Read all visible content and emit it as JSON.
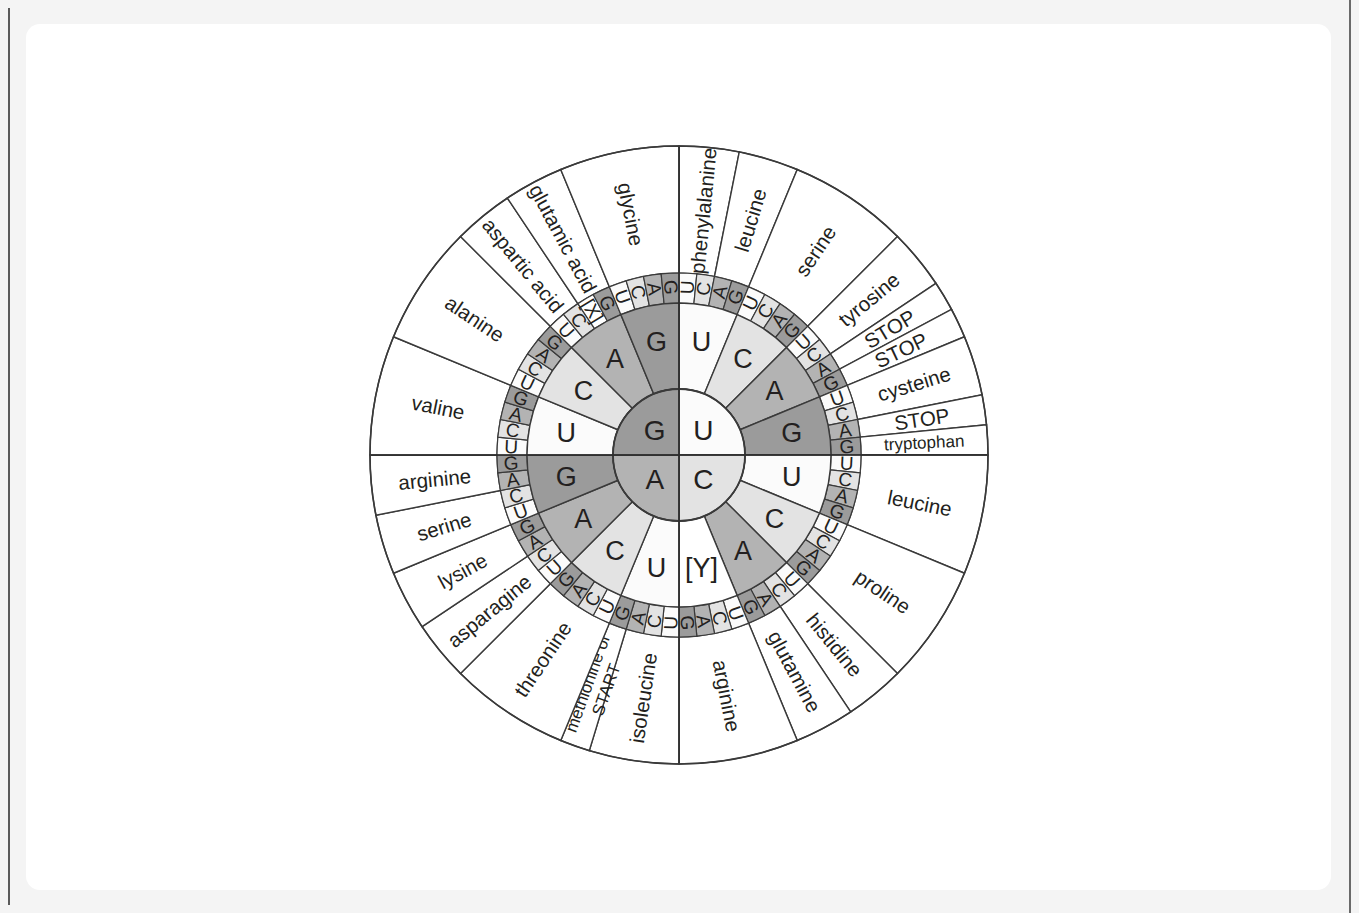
{
  "diagram": {
    "center_bases": [
      {
        "label": "U",
        "quadrant": "top-right",
        "shade": "lightest"
      },
      {
        "label": "C",
        "quadrant": "bottom-right",
        "shade": "light"
      },
      {
        "label": "A",
        "quadrant": "bottom-left",
        "shade": "medium"
      },
      {
        "label": "G",
        "quadrant": "top-left",
        "shade": "dark"
      }
    ],
    "ring2_bases": [
      "U",
      "C",
      "A",
      "G",
      "U",
      "C",
      "A",
      "[Y]",
      "U",
      "C",
      "A",
      "G",
      "U",
      "C",
      "A",
      "G"
    ],
    "ring3_bases": [
      "U",
      "C",
      "A",
      "G",
      "U",
      "C",
      "A",
      "G",
      "U",
      "C",
      "A",
      "G",
      "U",
      "C",
      "A",
      "G",
      "U",
      "C",
      "A",
      "G",
      "U",
      "C",
      "A",
      "G",
      "U",
      "C",
      "A",
      "G",
      "U",
      "C",
      "A",
      "G",
      "U",
      "C",
      "A",
      "G",
      "U",
      "C",
      "A",
      "G",
      "U",
      "C",
      "A",
      "G",
      "U",
      "C",
      "A",
      "G",
      "U",
      "C",
      "A",
      "G",
      "U",
      "C",
      "A",
      "G",
      "U",
      "C",
      "[X]",
      "G",
      "U",
      "C",
      "A",
      "G"
    ],
    "amino_acids": [
      {
        "name": "phenylalanine",
        "span": 2,
        "codons": [
          "UUU",
          "UUC"
        ]
      },
      {
        "name": "leucine",
        "span": 2,
        "codons": [
          "UUA",
          "UUG"
        ]
      },
      {
        "name": "serine",
        "span": 4,
        "codons": [
          "UCU",
          "UCC",
          "UCA",
          "UCG"
        ]
      },
      {
        "name": "tyrosine",
        "span": 2,
        "codons": [
          "UAU",
          "UAC"
        ]
      },
      {
        "name": "STOP",
        "span": 1,
        "codons": [
          "UAA"
        ]
      },
      {
        "name": "STOP",
        "span": 1,
        "codons": [
          "UAG"
        ]
      },
      {
        "name": "cysteine",
        "span": 2,
        "codons": [
          "UGU",
          "UGC"
        ]
      },
      {
        "name": "STOP",
        "span": 1,
        "codons": [
          "UGA"
        ]
      },
      {
        "name": "tryptophan",
        "span": 1,
        "codons": [
          "UGG"
        ]
      },
      {
        "name": "leucine",
        "span": 4,
        "codons": [
          "CUU",
          "CUC",
          "CUA",
          "CUG"
        ]
      },
      {
        "name": "proline",
        "span": 4,
        "codons": [
          "CCU",
          "CCC",
          "CCA",
          "CCG"
        ]
      },
      {
        "name": "histidine",
        "span": 2,
        "codons": [
          "CAU",
          "CAC"
        ]
      },
      {
        "name": "glutamine",
        "span": 2,
        "codons": [
          "CAA",
          "CAG"
        ]
      },
      {
        "name": "arginine",
        "span": 4,
        "codons": [
          "CGU",
          "CGC",
          "CGA",
          "CGG"
        ]
      },
      {
        "name": "isoleucine",
        "span": 3,
        "codons": [
          "AUU",
          "AUC",
          "AUA"
        ]
      },
      {
        "name": "methionine or START",
        "span": 1,
        "codons": [
          "AUG"
        ]
      },
      {
        "name": "threonine",
        "span": 4,
        "codons": [
          "ACU",
          "ACC",
          "ACA",
          "ACG"
        ]
      },
      {
        "name": "asparagine",
        "span": 2,
        "codons": [
          "AAU",
          "AAC"
        ]
      },
      {
        "name": "lysine",
        "span": 2,
        "codons": [
          "AAA",
          "AAG"
        ]
      },
      {
        "name": "serine",
        "span": 2,
        "codons": [
          "AGU",
          "AGC"
        ]
      },
      {
        "name": "arginine",
        "span": 2,
        "codons": [
          "AGA",
          "AGG"
        ]
      },
      {
        "name": "valine",
        "span": 4,
        "codons": [
          "GUU",
          "GUC",
          "GUA",
          "GUG"
        ]
      },
      {
        "name": "alanine",
        "span": 4,
        "codons": [
          "GCU",
          "GCC",
          "GCA",
          "GCG"
        ]
      },
      {
        "name": "aspartic acid",
        "span": 2,
        "codons": [
          "GAU",
          "GAC"
        ]
      },
      {
        "name": "glutamic acid",
        "span": 2,
        "codons": [
          "GAA",
          "GAG"
        ]
      },
      {
        "name": "glycine",
        "span": 4,
        "codons": [
          "GGU",
          "GGC",
          "GGA",
          "GGG"
        ]
      }
    ],
    "placeholders": {
      "x": "[X]",
      "y": "[Y]"
    },
    "colors": {
      "shade_lightest": "#fbfbfb",
      "shade_light": "#e3e3e3",
      "shade_medium": "#b3b3b3",
      "shade_dark": "#9b9b9b",
      "stroke": "#3a3a3a",
      "text": "#231f20",
      "paper": "#ffffff",
      "page_bg": "#f4f4f4"
    },
    "geometry": {
      "cx": 679,
      "cy": 455,
      "r_center": 66,
      "r_ring2": 152,
      "r_ring3": 182,
      "r_outer": 309
    }
  }
}
